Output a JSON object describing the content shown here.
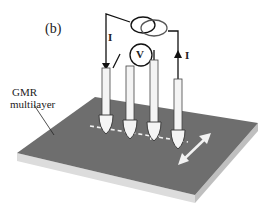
{
  "panel_label": "(b)",
  "sample_label_line1": "GMR",
  "sample_label_line2": "multilayer",
  "current_label_left": "I",
  "current_label_right": "I",
  "voltmeter_label": "V",
  "icons": {
    "current_source": "current-source-icon",
    "voltmeter": "voltmeter-icon",
    "probes": "probe-tip-icon",
    "scan_arrow": "double-arrow-icon"
  },
  "colors": {
    "slab_top": "#6e6e6e",
    "slab_side": "#d9d9d9",
    "wire": "#111111",
    "probe": "#f4f4f4"
  }
}
